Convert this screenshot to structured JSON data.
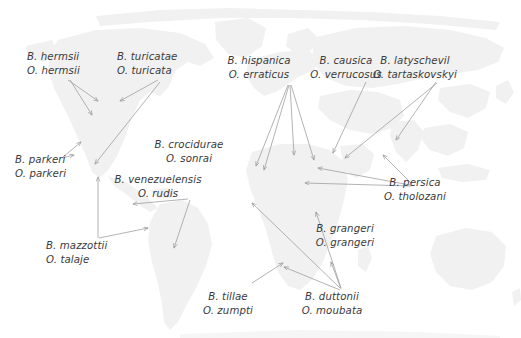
{
  "figure": {
    "name": "world-map-borrelia-ornithodoros-distribution",
    "width": 521,
    "height": 338,
    "background_color": "#ffffff",
    "land_color": "#f0f0f0",
    "text_color": "#3a3a3c",
    "arrow_color": "#9a9a9f"
  },
  "labels": [
    {
      "id": "hermsii",
      "line1": "B. hermsii",
      "line2": "O. hermsii",
      "x": 27,
      "y": 50,
      "align": "left"
    },
    {
      "id": "turicatae",
      "line1": "B. turicatae",
      "line2": "O. turicata",
      "x": 117,
      "y": 50,
      "align": "left"
    },
    {
      "id": "parkeri",
      "line1": "B. parkeri",
      "line2": "O. parkeri",
      "x": 15,
      "y": 153,
      "align": "left"
    },
    {
      "id": "mazzottii",
      "line1": "B. mazzottii",
      "line2": "O. talaje",
      "x": 46,
      "y": 239,
      "align": "left"
    },
    {
      "id": "venezuelensis",
      "line1": "B. venezuelensis",
      "line2": "O. rudis",
      "x": 158,
      "y": 173,
      "align": "center"
    },
    {
      "id": "crocidurae",
      "line1": "B. crocidurae",
      "line2": "O. sonrai",
      "x": 189,
      "y": 138,
      "align": "center"
    },
    {
      "id": "hispanica",
      "line1": "B. hispanica",
      "line2": "O. erraticus",
      "x": 259,
      "y": 54,
      "align": "center"
    },
    {
      "id": "causica",
      "line1": "B. causica",
      "line2": "O. verrucosus",
      "x": 346,
      "y": 54,
      "align": "center"
    },
    {
      "id": "latyschevil",
      "line1": "B. latyschevil",
      "line2": "O. tartaskovskyi",
      "x": 415,
      "y": 54,
      "align": "center"
    },
    {
      "id": "persica",
      "line1": "B. persica",
      "line2": "O. tholozani",
      "x": 415,
      "y": 176,
      "align": "center"
    },
    {
      "id": "grangeri",
      "line1": "B. grangeri",
      "line2": "O. grangeri",
      "x": 345,
      "y": 222,
      "align": "center"
    },
    {
      "id": "tillae",
      "line1": "B. tillae",
      "line2": "O. zumpti",
      "x": 228,
      "y": 290,
      "align": "center"
    },
    {
      "id": "duttonii",
      "line1": "B. duttonii",
      "line2": "O. moubata",
      "x": 332,
      "y": 290,
      "align": "center"
    }
  ],
  "arrows": [
    {
      "id": "hermsii-a",
      "from": [
        68,
        80
      ],
      "to": [
        98,
        101
      ]
    },
    {
      "id": "hermsii-b",
      "from": [
        70,
        80
      ],
      "to": [
        92,
        115
      ]
    },
    {
      "id": "turicatae-a",
      "from": [
        158,
        80
      ],
      "to": [
        120,
        101
      ]
    },
    {
      "id": "turicatae-b",
      "from": [
        160,
        82
      ],
      "to": [
        95,
        164
      ]
    },
    {
      "id": "parkeri-a",
      "from": [
        63,
        157
      ],
      "to": [
        81,
        142
      ]
    },
    {
      "id": "parkeri-b",
      "from": [
        62,
        158
      ],
      "to": [
        74,
        155
      ]
    },
    {
      "id": "mazzottii-a",
      "from": [
        98,
        238
      ],
      "to": [
        98,
        177
      ]
    },
    {
      "id": "mazzottii-b",
      "from": [
        99,
        238
      ],
      "to": [
        148,
        228
      ]
    },
    {
      "id": "rudis-a",
      "from": [
        188,
        199
      ],
      "to": [
        133,
        204
      ]
    },
    {
      "id": "rudis-b",
      "from": [
        190,
        200
      ],
      "to": [
        174,
        248
      ]
    },
    {
      "id": "hispanica-a",
      "from": [
        288,
        85
      ],
      "to": [
        256,
        166
      ]
    },
    {
      "id": "hispanica-b",
      "from": [
        289,
        85
      ],
      "to": [
        264,
        170
      ]
    },
    {
      "id": "hispanica-c",
      "from": [
        290,
        85
      ],
      "to": [
        294,
        155
      ]
    },
    {
      "id": "hispanica-d",
      "from": [
        291,
        85
      ],
      "to": [
        314,
        160
      ]
    },
    {
      "id": "causica-a",
      "from": [
        366,
        82
      ],
      "to": [
        333,
        153
      ]
    },
    {
      "id": "latyschevil-a",
      "from": [
        436,
        82
      ],
      "to": [
        396,
        140
      ]
    },
    {
      "id": "latyschevil-b",
      "from": [
        437,
        83
      ],
      "to": [
        345,
        158
      ]
    },
    {
      "id": "persica-a",
      "from": [
        410,
        185
      ],
      "to": [
        318,
        168
      ]
    },
    {
      "id": "persica-b",
      "from": [
        411,
        186
      ],
      "to": [
        305,
        183
      ]
    },
    {
      "id": "persica-c",
      "from": [
        412,
        184
      ],
      "to": [
        383,
        155
      ]
    },
    {
      "id": "duttonii-a",
      "from": [
        340,
        288
      ],
      "to": [
        252,
        203
      ]
    },
    {
      "id": "duttonii-b",
      "from": [
        341,
        288
      ],
      "to": [
        316,
        212
      ]
    },
    {
      "id": "duttonii-c",
      "from": [
        341,
        289
      ],
      "to": [
        331,
        262
      ]
    },
    {
      "id": "duttonii-d",
      "from": [
        340,
        290
      ],
      "to": [
        284,
        267
      ]
    },
    {
      "id": "tillae-a",
      "from": [
        252,
        283
      ],
      "to": [
        283,
        263
      ]
    }
  ]
}
